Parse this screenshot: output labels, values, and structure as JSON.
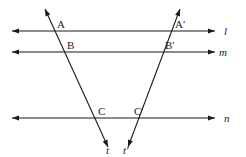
{
  "diagram": {
    "type": "parallel lines cut by two transversals",
    "colors": {
      "stroke": "#1a1a1a",
      "text": "#222222",
      "background": "#ffffff"
    },
    "parallel_lines": [
      {
        "id": "l",
        "label": "l",
        "y": 31,
        "x1": 12,
        "x2": 215,
        "label_x": 224,
        "label_y": 35
      },
      {
        "id": "m",
        "label": "m",
        "y": 52,
        "x1": 12,
        "x2": 215,
        "label_x": 219,
        "label_y": 56
      },
      {
        "id": "n",
        "label": "n",
        "y": 118,
        "x1": 12,
        "x2": 215,
        "label_x": 224,
        "label_y": 122
      }
    ],
    "transversals": [
      {
        "id": "t",
        "label": "t",
        "x1": 45,
        "y1": 9,
        "x2": 108,
        "y2": 147,
        "label_x": 106,
        "label_y": 154
      },
      {
        "id": "t_prime",
        "label": "t′",
        "x1": 180,
        "y1": 9,
        "x2": 128,
        "y2": 147,
        "label_x": 123,
        "label_y": 154
      }
    ],
    "points": [
      {
        "id": "A",
        "label": "A",
        "x": 57,
        "y": 28
      },
      {
        "id": "B",
        "label": "B",
        "x": 67,
        "y": 49
      },
      {
        "id": "C",
        "label": "C",
        "x": 98,
        "y": 115
      },
      {
        "id": "A_prime",
        "label": "A′",
        "x": 175,
        "y": 28
      },
      {
        "id": "B_prime",
        "label": "B′",
        "x": 165,
        "y": 49
      },
      {
        "id": "C_prime",
        "label": "C′",
        "x": 134,
        "y": 115
      }
    ]
  }
}
